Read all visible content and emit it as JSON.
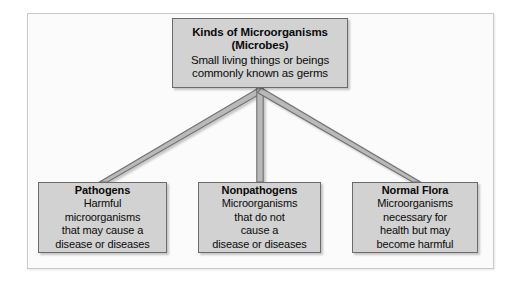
{
  "figure": {
    "kind": "hierarchy-diagram",
    "colors": {
      "page_background": "#ffffff",
      "frame_background": "#fbfbfb",
      "frame_border": "#c9c9c9",
      "box_fill": "#d2d2d2",
      "box_border": "#6b6b6b",
      "connector_stroke": "#6f6f6f",
      "connector_fill": "#b9b9b9",
      "text": "#0a0a0a"
    }
  },
  "root_node": {
    "title": "Kinds of Microorganisms",
    "subtitle": "(Microbes)",
    "body_lines": [
      "Small living things or beings",
      "commonly known as germs"
    ]
  },
  "leaf_nodes": [
    {
      "title": "Pathogens",
      "body_lines": [
        "Harmful",
        "microorganisms",
        "that may cause a",
        "disease or diseases"
      ]
    },
    {
      "title": "Nonpathogens",
      "body_lines": [
        "Microorganisms",
        "that do not",
        "cause a",
        "disease or diseases"
      ]
    },
    {
      "title": "Normal Flora",
      "body_lines": [
        "Microorganisms",
        "necessary for",
        "health but may",
        "become harmful"
      ]
    }
  ],
  "connectors": [
    {
      "name": "root-to-pathogens",
      "from": "root_node",
      "to": "Pathogens"
    },
    {
      "name": "root-to-nonpathogens",
      "from": "root_node",
      "to": "Nonpathogens"
    },
    {
      "name": "root-to-normal-flora",
      "from": "root_node",
      "to": "Normal Flora"
    }
  ]
}
